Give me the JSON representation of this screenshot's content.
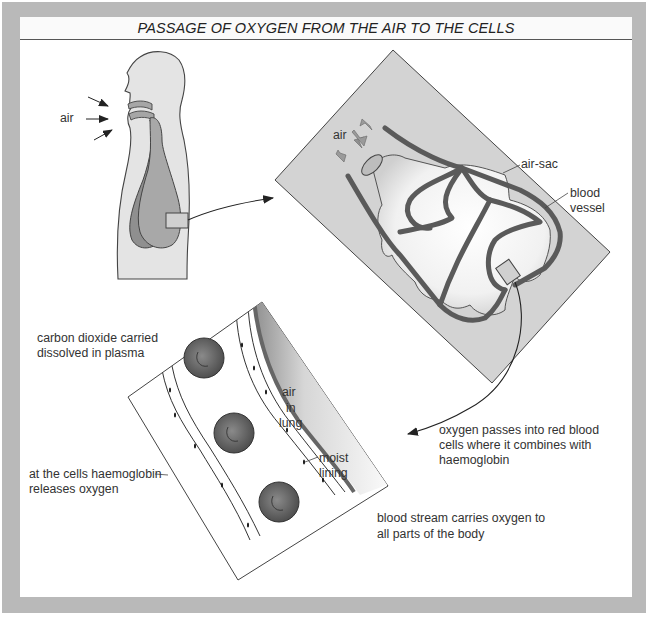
{
  "title": "PASSAGE OF OXYGEN FROM THE AIR TO THE CELLS",
  "colors": {
    "frame": "#b9b9b9",
    "panel": "#ffffff",
    "body_fill": "#e2e2e2",
    "lung_fill": "#a6a6a6",
    "vessel": "#5a5a5a",
    "alveolus_panel": "#d3d3d3",
    "red_cell": "#5f5f5f",
    "ink": "#222222"
  },
  "labels": {
    "air_body": "air",
    "air_sac_panel": "air",
    "air_sac": "air-sac",
    "blood_vessel_line1": "blood",
    "blood_vessel_line2": "vessel",
    "air_in_lung_1": "air",
    "air_in_lung_2": "in",
    "air_in_lung_3": "lung",
    "moist_lining_1": "moist",
    "moist_lining_2": "lining",
    "co2_line1": "carbon dioxide carried",
    "co2_line2": "dissolved in plasma",
    "release_line1": "at the cells haemoglobin",
    "release_line2": "releases oxygen",
    "oxygen_line1": "oxygen passes into red blood",
    "oxygen_line2": "cells where it combines with",
    "oxygen_line3": "haemoglobin",
    "stream_line1": "blood stream carries oxygen to",
    "stream_line2": "all parts of the body"
  },
  "panels": [
    {
      "name": "human-torso",
      "description": "side view of head and chest with lungs"
    },
    {
      "name": "air-sac-detail",
      "description": "magnified alveolus with capillary network"
    },
    {
      "name": "capillary-wall-detail",
      "description": "cross-section with red blood cells beside air in lung"
    }
  ]
}
